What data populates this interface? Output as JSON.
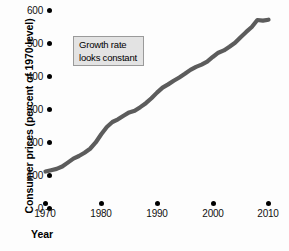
{
  "chart_data": {
    "type": "line",
    "title": "",
    "xlabel": "Year",
    "ylabel": "Consumer prices (percent of 1970 level)",
    "xlim": [
      1970,
      2010
    ],
    "ylim": [
      0,
      600
    ],
    "grid": false,
    "legend": null,
    "line_color": "#5c5c5c",
    "axis_color": "#000000",
    "x_ticks": [
      1970,
      1980,
      1990,
      2000,
      2010
    ],
    "y_ticks": [
      0,
      100,
      200,
      300,
      400,
      500,
      600
    ],
    "x_tick_labels": [
      "1970",
      "1980",
      "1990",
      "2000",
      "2010"
    ],
    "y_tick_labels": [
      "0",
      "100",
      "200",
      "300",
      "400",
      "500",
      "600"
    ],
    "annotations": [
      {
        "text_lines": [
          "Growth rate",
          "looks constant"
        ],
        "x": 1972,
        "y": 520
      }
    ],
    "series": [
      {
        "name": "Consumer prices (percent of 1970 level)",
        "x": [
          1970,
          1971,
          1972,
          1973,
          1974,
          1975,
          1976,
          1977,
          1978,
          1979,
          1980,
          1981,
          1982,
          1983,
          1984,
          1985,
          1986,
          1987,
          1988,
          1989,
          1990,
          1991,
          1992,
          1993,
          1994,
          1995,
          1996,
          1997,
          1998,
          1999,
          2000,
          2001,
          2002,
          2003,
          2004,
          2005,
          2006,
          2007,
          2008,
          2009,
          2010
        ],
        "values": [
          100,
          104,
          108,
          115,
          127,
          139,
          147,
          157,
          169,
          188,
          213,
          235,
          250,
          258,
          269,
          279,
          284,
          295,
          307,
          322,
          339,
          354,
          364,
          375,
          385,
          396,
          408,
          417,
          424,
          433,
          447,
          460,
          467,
          478,
          490,
          507,
          523,
          538,
          559,
          557,
          560
        ]
      }
    ]
  },
  "axes": {
    "y_title": "Consumer prices (percent of 1970 level)",
    "x_title": "Year",
    "y_ticks": [
      {
        "label": "600",
        "top": 4
      },
      {
        "label": "500",
        "top": 37
      },
      {
        "label": "400",
        "top": 70
      },
      {
        "label": "300",
        "top": 103
      },
      {
        "label": "200",
        "top": 136
      },
      {
        "label": "100",
        "top": 169
      },
      {
        "label": "0",
        "top": 202
      }
    ],
    "x_ticks": [
      {
        "label": "1970",
        "left": 25
      },
      {
        "label": "1980",
        "left": 81
      },
      {
        "label": "1990",
        "left": 137
      },
      {
        "label": "2000",
        "left": 193
      },
      {
        "label": "2010",
        "left": 248
      }
    ]
  },
  "annotation": {
    "line1": "Growth rate",
    "line2": "looks constant"
  }
}
